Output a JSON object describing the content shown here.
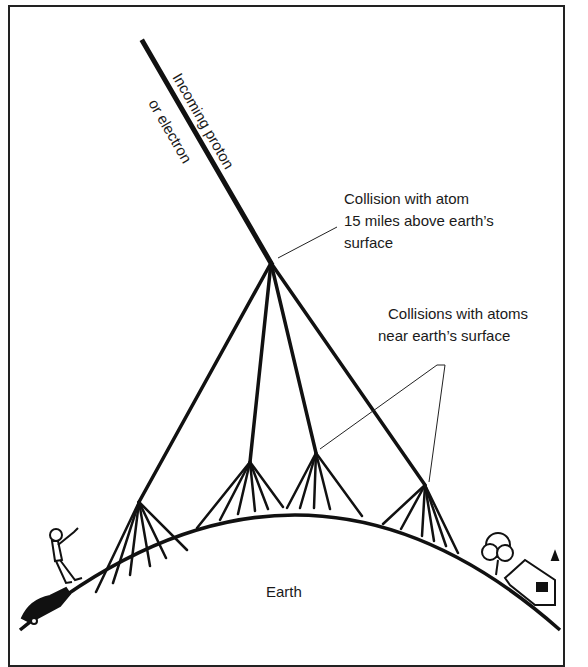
{
  "diagram": {
    "labels": {
      "incoming_line1": "Incoming proton",
      "incoming_line2": "or electron",
      "collision_upper_line1": "Collision with atom",
      "collision_upper_line2": "15 miles above earth’s",
      "collision_upper_line3": "surface",
      "collision_lower_line1": "Collisions with atoms",
      "collision_lower_line2": "near earth’s surface",
      "earth": "Earth"
    },
    "nodes": {
      "incoming_start": [
        143,
        42
      ],
      "primary_collision": [
        271,
        263
      ],
      "secondary_collisions": [
        [
          139,
          502
        ],
        [
          250,
          462
        ],
        [
          316,
          453
        ],
        [
          425,
          485
        ]
      ]
    },
    "colors": {
      "ink": "#111111",
      "background": "#ffffff"
    }
  }
}
